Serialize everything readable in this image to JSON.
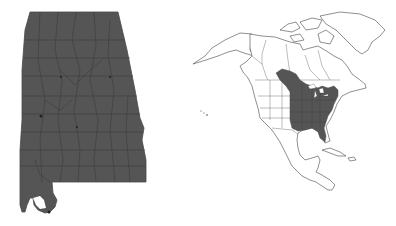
{
  "figure": {
    "left_map": {
      "label": "Alabama county map",
      "region": "Alabama",
      "fill_color": "#555555",
      "border_color": "#3a3a3a",
      "all_counties_shaded": true
    },
    "right_map": {
      "label": "North America distribution map",
      "region": "North America",
      "shaded_area": "Eastern United States and southeastern Canada",
      "shaded_color": "#555555",
      "outline_color": "#444444",
      "land_color": "#ffffff"
    }
  }
}
